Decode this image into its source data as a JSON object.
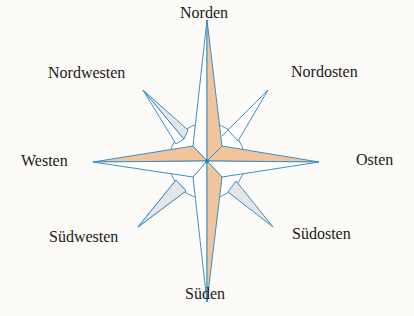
{
  "labels": {
    "n": "Norden",
    "ne": "Nordosten",
    "e": "Osten",
    "se": "Südosten",
    "s": "Süden",
    "sw": "Südwesten",
    "w": "Westen",
    "nw": "Nordwesten"
  },
  "colors": {
    "stroke": "#3d8fc4",
    "main_fill": "#f2c49c",
    "diag_fill": "#e3e6e8",
    "background": "#fbfaf6"
  }
}
